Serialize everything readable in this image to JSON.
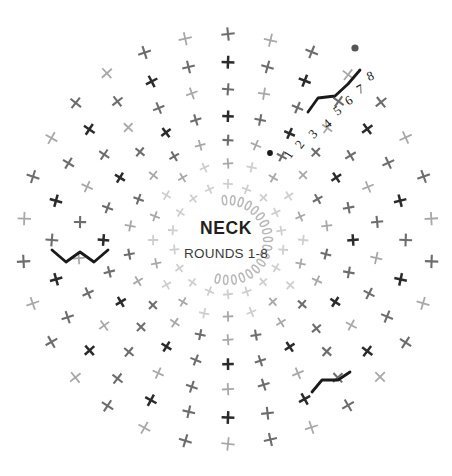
{
  "diagram": {
    "kind": "crochet-stitch-chart",
    "title": "NECK",
    "subtitle": "ROUNDS 1-8",
    "background_color": "#ffffff",
    "center": {
      "x": 228,
      "y": 240
    },
    "size": {
      "width": 452,
      "height": 476
    },
    "colors": {
      "dark_stitch": "#2b2b2b",
      "mid_stitch": "#6d6d6d",
      "light_stitch": "#a8a8a8",
      "faint_stitch": "#cfcfcf",
      "chain_oval": "#b9b9b9",
      "join_line": "#1a1a1a",
      "start_dot": "#1a1a1a",
      "end_dot": "#555555",
      "title_text": "#231f20",
      "subtitle_text": "#3a3a3a"
    },
    "round_labels": [
      {
        "label": "1",
        "x": 292,
        "y": 157,
        "rotate": -58,
        "size": 13
      },
      {
        "label": "2",
        "x": 303,
        "y": 147,
        "rotate": -52,
        "size": 13
      },
      {
        "label": "3",
        "x": 316,
        "y": 137,
        "rotate": -46,
        "size": 13
      },
      {
        "label": "4",
        "x": 330,
        "y": 127,
        "rotate": -40,
        "size": 13
      },
      {
        "label": "5",
        "x": 340,
        "y": 114,
        "rotate": -36,
        "size": 13
      },
      {
        "label": "6",
        "x": 351,
        "y": 104,
        "rotate": -32,
        "size": 13
      },
      {
        "label": "7",
        "x": 362,
        "y": 93,
        "rotate": -28,
        "size": 13
      },
      {
        "label": "8",
        "x": 372,
        "y": 80,
        "rotate": -24,
        "size": 13
      }
    ],
    "markers": [
      {
        "name": "start-dot",
        "x": 270,
        "y": 153,
        "r": 2.9,
        "color": "#1a1a1a"
      },
      {
        "name": "end-dot",
        "x": 355,
        "y": 48,
        "r": 3.6,
        "color": "#555555"
      }
    ],
    "legend_note": "Crosses = single crochet stitches; small ovals = chain stitches; bold angled lines = round joins / turning chains",
    "rings": [
      {
        "round": 1,
        "radius": 36,
        "count": 16,
        "stitch": "chain",
        "color": "#cfcfcf"
      },
      {
        "round": 2,
        "radius": 55,
        "count": 18,
        "stitch": "cross",
        "color": "#cfcfcf"
      },
      {
        "round": 3,
        "radius": 76,
        "count": 20,
        "stitch": "cross",
        "color": "#a8a8a8"
      },
      {
        "round": 4,
        "radius": 99,
        "count": 22,
        "stitch": "cross",
        "color": "#6d6d6d"
      },
      {
        "round": 5,
        "radius": 124,
        "count": 24,
        "stitch": "cross",
        "color": "#2b2b2b"
      },
      {
        "round": 6,
        "radius": 150,
        "count": 26,
        "stitch": "cross",
        "color": "#6d6d6d"
      },
      {
        "round": 7,
        "radius": 177,
        "count": 28,
        "stitch": "cross",
        "color": "#2b2b2b"
      },
      {
        "round": 8,
        "radius": 205,
        "count": 30,
        "stitch": "cross",
        "color": "#6d6d6d"
      }
    ],
    "chain_arc": {
      "radius": 40,
      "start_angle": -95,
      "end_angle": 105,
      "count": 18,
      "color": "#b9b9b9"
    },
    "joins": [
      {
        "name": "join-upper-right",
        "points": "308,112 318,98 335,96 348,84 360,70",
        "color": "#1a1a1a"
      },
      {
        "name": "join-left",
        "points": "52,250 66,262 80,252 94,262 108,250",
        "color": "#1a1a1a"
      },
      {
        "name": "join-lower-right",
        "points": "312,392 322,380 338,380 350,372",
        "color": "#1a1a1a"
      }
    ]
  }
}
